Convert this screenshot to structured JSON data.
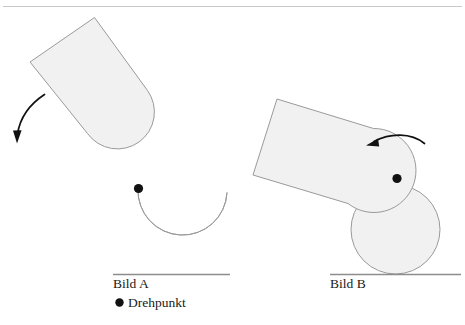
{
  "figure": {
    "background_color": "#ffffff",
    "shape_fill_color": "#f1f1f1",
    "shape_stroke_color": "#9a9a9a",
    "ink_color": "#111111",
    "baseline_color": "#8d8d8d",
    "top_rule_color": "#c9c9c9"
  },
  "panels": [
    {
      "id": "panel-a",
      "caption": "Bild A",
      "pivot_label": "Drehpunkt",
      "rotation_direction": "counterclockwise-down-left",
      "description": "Rotating lever (rectangle fused with disc) separated from a notched disc resting on the ground line; pivot dot at the contact point between the two discs."
    },
    {
      "id": "panel-b",
      "caption": "Bild B",
      "rotation_direction": "counterclockwise-left",
      "description": "Lever (rectangle fused with disc) overlapping a second disc resting on the ground line; pivot dot at the centre of the lever disc."
    }
  ],
  "legend": {
    "marker": "pivot-dot",
    "label": "Drehpunkt"
  },
  "captions": {
    "left": "Bild A",
    "right": "Bild B"
  }
}
